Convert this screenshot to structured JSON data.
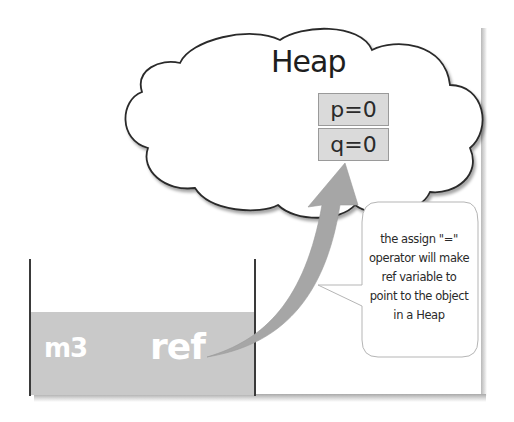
{
  "diagram": {
    "type": "memory-model",
    "heap": {
      "title": "Heap",
      "shape": "cloud",
      "object_fields": [
        {
          "label": "p=0"
        },
        {
          "label": "q=0"
        }
      ]
    },
    "stack": {
      "frame_label": "m3",
      "variable_label": "ref"
    },
    "arrow": {
      "from": "ref",
      "to": "heap-object",
      "color": "#a6a6a6"
    },
    "callout": {
      "lines": [
        "the assign \"=\"",
        "operator will make",
        "ref variable to",
        "point to the object",
        "in a Heap"
      ]
    },
    "colors": {
      "stack_fill": "#c9c9c9",
      "heap_field_fill": "#dadada",
      "outline": "#2a2a2a",
      "arrow": "#a6a6a6"
    }
  }
}
